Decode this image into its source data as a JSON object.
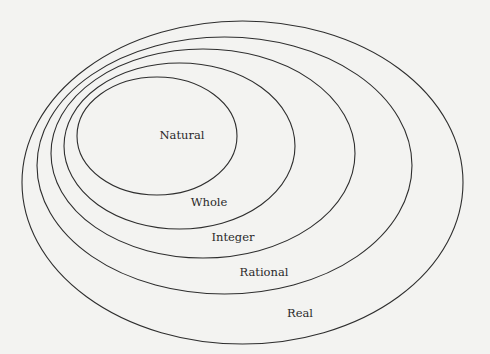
{
  "diagram": {
    "type": "nested-sets",
    "background": "#f3f3f1",
    "stroke_color": "#2e2e2e",
    "sets": [
      {
        "label": "Real",
        "cx": 242.5,
        "cy": 182.5,
        "rx": 220.5,
        "ry": 161.5,
        "label_x": 300,
        "label_y": 317
      },
      {
        "label": "Rational",
        "cx": 224.5,
        "cy": 165.5,
        "rx": 187.5,
        "ry": 128.5,
        "label_x": 264,
        "label_y": 276
      },
      {
        "label": "Integer",
        "cx": 203,
        "cy": 153.5,
        "rx": 152,
        "ry": 104.5,
        "label_x": 233,
        "label_y": 241
      },
      {
        "label": "Whole",
        "cx": 179.5,
        "cy": 146,
        "rx": 115.5,
        "ry": 83,
        "label_x": 209,
        "label_y": 206
      },
      {
        "label": "Natural",
        "cx": 157,
        "cy": 136,
        "rx": 80,
        "ry": 59,
        "label_x": 182,
        "label_y": 139
      }
    ]
  }
}
